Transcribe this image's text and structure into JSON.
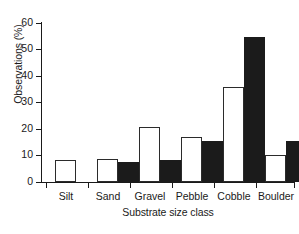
{
  "chart_data": {
    "type": "bar",
    "title": "",
    "xlabel": "Substrate size class",
    "ylabel": "Observations (%)",
    "categories": [
      "Silt",
      "Sand",
      "Gravel",
      "Pebble",
      "Cobble",
      "Boulder"
    ],
    "ylim": [
      0,
      60
    ],
    "yticks": [
      0,
      10,
      20,
      30,
      40,
      50,
      60
    ],
    "ytick_labels": [
      "0",
      "10",
      "20",
      "30",
      "40",
      "50",
      "60"
    ],
    "grid": false,
    "legend": "none",
    "series": [
      {
        "name": "open",
        "style": "open-white-bar",
        "values": [
          8.3,
          8.8,
          20.5,
          17.0,
          35.8,
          10.0
        ]
      },
      {
        "name": "filled",
        "style": "solid-black-bar",
        "values": [
          0,
          7.4,
          8.1,
          15.3,
          54.5,
          15.4
        ]
      }
    ],
    "colors": {
      "open_fill": "#ffffff",
      "open_edge": "#2b2b2b",
      "filled_fill": "#1b1b1b",
      "axis": "#1a1a1a",
      "background": "#ffffff"
    }
  }
}
